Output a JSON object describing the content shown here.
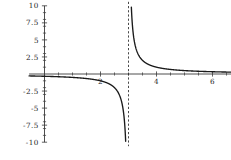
{
  "chart_data": {
    "type": "line",
    "title": "",
    "subtitle": "",
    "xlabel": "",
    "ylabel": "",
    "function": "y = 1/(x - 3)",
    "xlim": [
      -0.55,
      7.2
    ],
    "ylim": [
      -10,
      10
    ],
    "grid": false,
    "legend": null,
    "legend_position": "none",
    "axis_color": "#3a3a3a",
    "curve_color": "#1a1a1a",
    "asymptote_color": "#2a2a2a",
    "background_color": "#ffffff",
    "x_ticks_major": [
      2,
      4,
      6
    ],
    "x_tick_labels": [
      "2",
      "4",
      "6"
    ],
    "x_ticks_minor": [
      0.5,
      1,
      1.5,
      2.5,
      3,
      3.5,
      4.5,
      5,
      5.5,
      6.5,
      7
    ],
    "y_ticks_major": [
      -10,
      -7.5,
      -5,
      -2.5,
      2.5,
      5,
      7.5,
      10
    ],
    "y_tick_labels": [
      "-10",
      "-7.5",
      "-5",
      "-2.5",
      "2.5",
      "5",
      "7.5",
      "10"
    ],
    "y_ticks_minor": [
      -9,
      -8,
      -7,
      -6,
      -4,
      -3,
      -2,
      -1,
      1,
      2,
      3,
      4,
      6,
      7,
      8,
      9
    ],
    "annotations": [
      {
        "name": "vertical-asymptote",
        "kind": "vertical-dashed-line",
        "x": 3,
        "label": "x = 3"
      }
    ],
    "series": [
      {
        "name": "left-branch",
        "note": "x < 3, decreasing to -infinity as x approaches 3",
        "x": [
          -0.55,
          -0.2,
          0.2,
          0.6,
          1.0,
          1.4,
          1.8,
          2.0,
          2.2,
          2.4,
          2.5,
          2.6,
          2.7,
          2.75,
          2.8,
          2.85,
          2.9,
          2.92,
          2.94,
          2.95
        ],
        "y": [
          -0.282,
          -0.313,
          -0.357,
          -0.417,
          -0.5,
          -0.625,
          -0.833,
          -1.0,
          -1.25,
          -1.667,
          -2.0,
          -2.5,
          -3.333,
          -4.0,
          -5.0,
          -6.667,
          -10.0,
          -12.5,
          -16.667,
          -20.0
        ]
      },
      {
        "name": "right-branch",
        "note": "x > 3, decreasing from +infinity toward 0",
        "x": [
          3.05,
          3.06,
          3.08,
          3.1,
          3.15,
          3.2,
          3.25,
          3.3,
          3.4,
          3.5,
          3.6,
          3.8,
          4.0,
          4.4,
          4.8,
          5.2,
          5.6,
          6.0,
          6.4,
          6.8,
          7.2
        ],
        "y": [
          20.0,
          16.667,
          12.5,
          10.0,
          6.667,
          5.0,
          4.0,
          3.333,
          2.5,
          2.0,
          1.667,
          1.25,
          1.0,
          0.714,
          0.556,
          0.455,
          0.385,
          0.333,
          0.294,
          0.263,
          0.238
        ]
      }
    ]
  }
}
